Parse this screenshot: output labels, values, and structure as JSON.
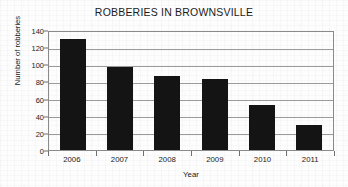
{
  "chart_data": {
    "type": "bar",
    "title": "ROBBERIES IN BROWNSVILLE",
    "xlabel": "Year",
    "ylabel": "Number of robberies",
    "categories": [
      "2006",
      "2007",
      "2008",
      "2009",
      "2010",
      "2011"
    ],
    "values": [
      130,
      97,
      86,
      83,
      52,
      29
    ],
    "ylim": [
      0,
      140
    ],
    "ytick_step": 20,
    "yticks": [
      0,
      20,
      40,
      60,
      80,
      100,
      120,
      140
    ],
    "ytick_labels": [
      "0",
      "20",
      "40",
      "60",
      "80",
      "100",
      "120",
      "140"
    ],
    "grid": "horizontal",
    "legend": null,
    "bar_color": "#141414",
    "background_color": "#fdfdfd",
    "gridline_color": "#9a9a9a",
    "axis_color": "#8a8a8a"
  }
}
